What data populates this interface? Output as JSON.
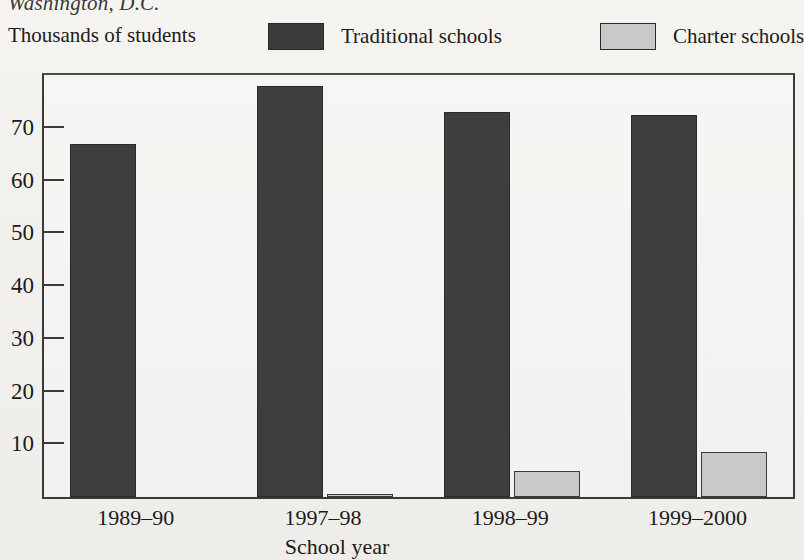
{
  "figure": {
    "source_title": "Washington, D.C.",
    "axis_title_y": "Thousands of students",
    "axis_title_x": "School year"
  },
  "legend": {
    "position": "top",
    "items": [
      {
        "label": "Traditional schools",
        "swatch": "dark-swatch-icon",
        "color": "#3e3e3e"
      },
      {
        "label": "Charter schools",
        "swatch": "light-swatch-icon",
        "color": "#c9c9c9"
      }
    ]
  },
  "chart_data": {
    "type": "bar",
    "title": "Washington, D.C.",
    "xlabel": "School year",
    "ylabel": "Thousands of students",
    "categories": [
      "1989–90",
      "1997–98",
      "1998–99",
      "1999–2000"
    ],
    "series": [
      {
        "name": "Traditional schools",
        "color": "#3e3e3e",
        "values": [
          67,
          78,
          73,
          72.5
        ]
      },
      {
        "name": "Charter schools",
        "color": "#c9c9c9",
        "values": [
          0,
          0.3,
          5,
          8.5
        ]
      }
    ],
    "ylim": [
      0,
      80
    ],
    "yticks": [
      10,
      20,
      30,
      40,
      50,
      60,
      70
    ],
    "ytick_labels": [
      "10",
      "20",
      "30",
      "40",
      "50",
      "60",
      "70"
    ],
    "grid": false,
    "legend_position": "top"
  }
}
